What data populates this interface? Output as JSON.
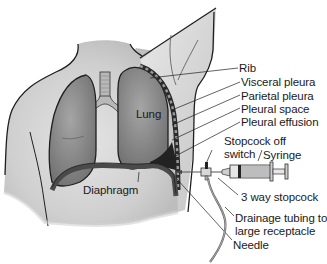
{
  "diagram": {
    "labels": {
      "rib": "Rib",
      "visceral_pleura": "Visceral pleura",
      "parietal_pleura": "Parietal pleura",
      "pleural_space": "Pleural space",
      "pleural_effusion": "Pleural effusion",
      "stopcock_off_switch_line1": "Stopcock off",
      "stopcock_off_switch_line2": "switch",
      "syringe": "Syringe",
      "three_way_stopcock": "3 way stopcock",
      "drainage_tubing_line1": "Drainage tubing to",
      "drainage_tubing_line2": "large receptacle",
      "needle": "Needle",
      "lung": "Lung",
      "diaphragm": "Diaphragm"
    },
    "colors": {
      "background": "#ffffff",
      "skin": "#d9d9d9",
      "lung": "#8a8a8a",
      "outline": "#1f1f1f",
      "diaphragm": "#555555",
      "effusion": "#2a2a2a",
      "text": "#1a1a1a"
    }
  }
}
